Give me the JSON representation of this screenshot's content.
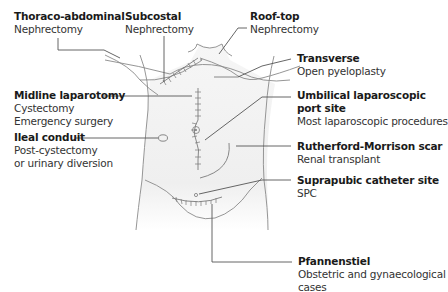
{
  "diagram": {
    "colors": {
      "body_fill": "#f1f1f1",
      "outline": "#8a8a8a",
      "scar": "#7a7a7a",
      "leader": "#555555",
      "text": "#222222"
    },
    "labels": [
      {
        "id": "thoraco-abdominal",
        "title": "Thoraco-abdominal",
        "lines": [
          "Nephrectomy"
        ]
      },
      {
        "id": "subcostal",
        "title": "Subcostal",
        "lines": [
          "Nephrectomy"
        ]
      },
      {
        "id": "roof-top",
        "title": "Roof-top",
        "lines": [
          "Nephrectomy"
        ]
      },
      {
        "id": "transverse",
        "title": "Transverse",
        "lines": [
          "Open pyeloplasty"
        ]
      },
      {
        "id": "midline-laparotomy",
        "title": "Midline laparotomy",
        "lines": [
          "Cystectomy",
          "Emergency surgery"
        ]
      },
      {
        "id": "umbilical-port",
        "title": "Umbilical laparoscopic",
        "title2": "port site",
        "lines": [
          "Most laparoscopic procedures"
        ]
      },
      {
        "id": "ileal-conduit",
        "title": "Ileal conduit",
        "lines": [
          "Post-cystectomy",
          "or urinary diversion"
        ]
      },
      {
        "id": "rutherford-morrison",
        "title": "Rutherford-Morrison scar",
        "lines": [
          "Renal transplant"
        ]
      },
      {
        "id": "suprapubic",
        "title": "Suprapubic catheter site",
        "lines": [
          "SPC"
        ]
      },
      {
        "id": "pfannenstiel",
        "title": "Pfannenstiel",
        "lines": [
          "Obstetric and gynaecological",
          "cases"
        ]
      }
    ]
  }
}
